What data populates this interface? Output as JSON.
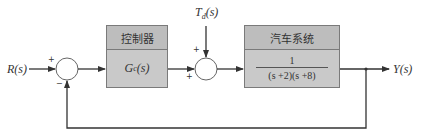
{
  "diagram": {
    "input_label": "R(s)",
    "output_label": "Y(s)",
    "disturbance_label": "T",
    "disturbance_sub": "d",
    "disturbance_arg": "(s)",
    "controller": {
      "title": "控制器",
      "transfer_function": "G",
      "tf_sub": "c",
      "tf_arg": "(s)"
    },
    "plant": {
      "title": "汽车系统",
      "numerator": "1",
      "denominator": "(s +2)(s +8)"
    },
    "summer1": {
      "top_sign": "+",
      "bottom_sign": "−"
    },
    "summer2": {
      "top_sign": "+",
      "bottom_sign": "+"
    },
    "colors": {
      "line": "#333333",
      "box_fill": "#c9c9c9",
      "box_border": "#7a7a7a"
    }
  }
}
